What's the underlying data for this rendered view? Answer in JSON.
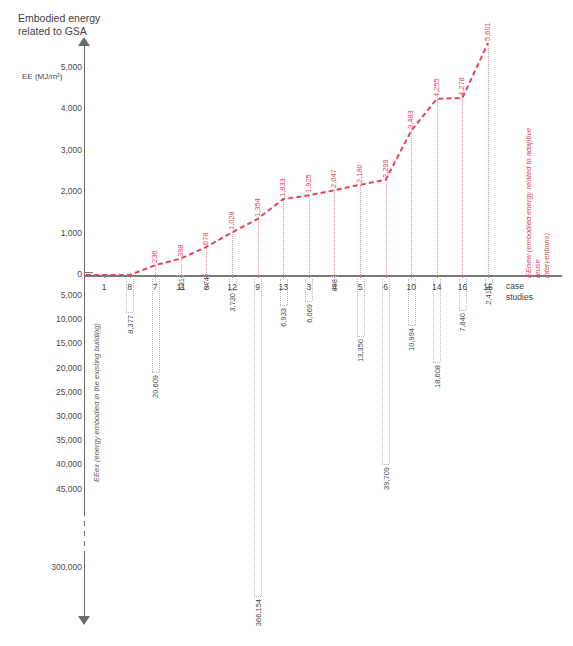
{
  "title": "Embodied energy\nrelated to GSA",
  "axis": {
    "upper_unit": "EE (MJ/m²)",
    "x_caption": "case\nstudies",
    "lower_axis_label": "EEex (energy embodied in the existing building)",
    "upper_series_label": "EEnew (embodied energy related to adaptive reuse\ninterventions)",
    "upper_ticks": [
      "0",
      "1,000",
      "2,000",
      "3,000",
      "4,000",
      "5,000"
    ],
    "lower_ticks": [
      "5,000",
      "10,000",
      "15,000",
      "20,000",
      "25,000",
      "30,000",
      "35,000",
      "40,000",
      "45,000"
    ],
    "break_tick": "300,000"
  },
  "colors": {
    "accent_red": "#e2445c",
    "axis_gray": "#6b6b6b",
    "grid_gray": "#b9b9b9",
    "text_gray": "#4a4a4a"
  },
  "chart_data": {
    "type": "line",
    "title": "Embodied energy related to GSA",
    "xlabel": "case studies",
    "ylabel": "EE (MJ/m²)",
    "grid": true,
    "legend": "none",
    "categories": [
      "1",
      "8",
      "7",
      "11",
      "2",
      "12",
      "9",
      "13",
      "3",
      "4",
      "5",
      "6",
      "10",
      "14",
      "16",
      "15"
    ],
    "upper_ylim": [
      0,
      5600
    ],
    "lower_ylim": [
      0,
      45000
    ],
    "lower_break_value": 300000,
    "series": [
      {
        "name": "EEnew (embodied energy related to adaptive reuse interventions)",
        "direction": "up",
        "color": "#e2445c",
        "values": [
          0,
          0,
          236,
          398,
          678,
          1028,
          1354,
          1833,
          1925,
          2047,
          2180,
          2299,
          3483,
          4255,
          4278,
          5601
        ],
        "labels": [
          "",
          "",
          "236",
          "398",
          "678",
          "1,028",
          "1,354",
          "1,833",
          "1,925",
          "2,047",
          "2,180",
          "2,299",
          "3,483",
          "4,255",
          "4,278",
          "5,601"
        ]
      },
      {
        "name": "EEex (energy embodied in the existing building)",
        "direction": "down",
        "color": "#8a8a8a",
        "values": [
          0,
          8377,
          20609,
          631,
          374,
          3730,
          366154,
          6933,
          6069,
          898,
          13350,
          39709,
          10994,
          18608,
          7840,
          2414
        ],
        "labels": [
          "",
          "8,377",
          "20,609",
          "631",
          "374",
          "3,730",
          "366,154",
          "6,933",
          "6,069",
          "898",
          "13,350",
          "39,709",
          "10,994",
          "18,608",
          "7,840",
          "2,414"
        ]
      }
    ]
  }
}
